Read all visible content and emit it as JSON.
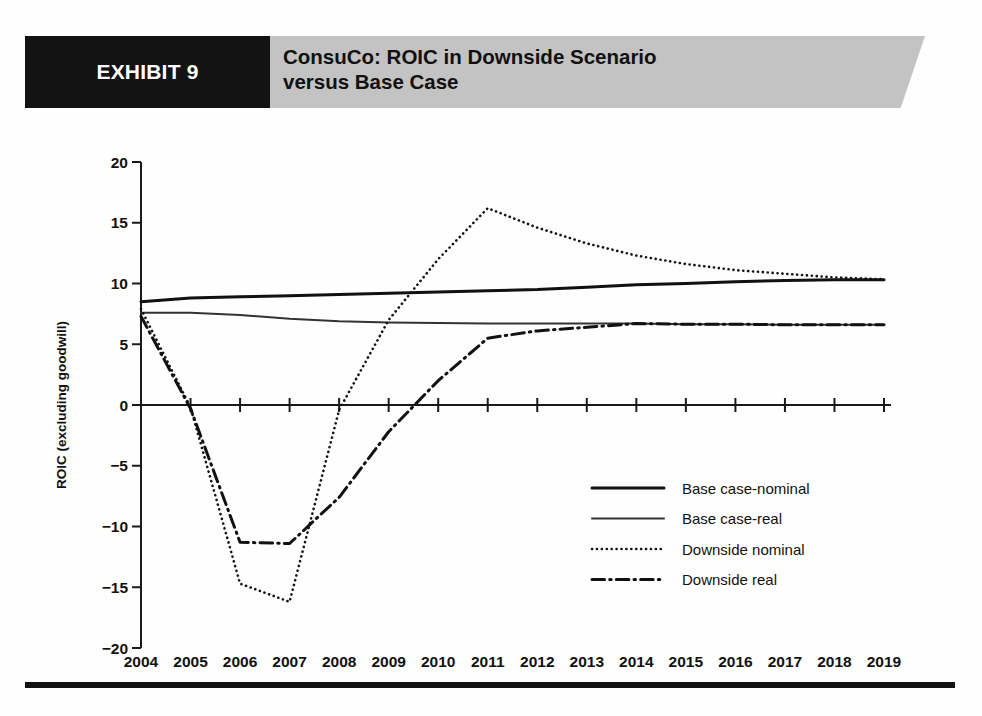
{
  "header": {
    "exhibit_label": "EXHIBIT 9",
    "title_line1": "ConsuCo: ROIC in Downside Scenario",
    "title_line2": "versus Base Case",
    "black_box_color": "#131313",
    "banner_color": "#c3c3c3"
  },
  "chart_data": {
    "type": "line",
    "title": "ConsuCo: ROIC in Downside Scenario versus Base Case",
    "xlabel": "",
    "ylabel": "ROIC (excluding goodwill)",
    "categories": [
      "2004",
      "2005",
      "2006",
      "2007",
      "2008",
      "2009",
      "2010",
      "2011",
      "2012",
      "2013",
      "2014",
      "2015",
      "2016",
      "2017",
      "2018",
      "2019"
    ],
    "x": [
      2004,
      2005,
      2006,
      2007,
      2008,
      2009,
      2010,
      2011,
      2012,
      2013,
      2014,
      2015,
      2016,
      2017,
      2018,
      2019
    ],
    "ylim": [
      -20,
      20
    ],
    "yticks": [
      20,
      15,
      10,
      5,
      0,
      -5,
      -10,
      -15,
      -20
    ],
    "ytick_labels": [
      "20",
      "15",
      "10",
      "5",
      "0",
      "−5",
      "−10",
      "−15",
      "−20"
    ],
    "grid": false,
    "legend_position": "center-right",
    "series": [
      {
        "name": "Base case-nominal",
        "style": "solid",
        "width": 3,
        "color": "#111111",
        "values": [
          8.5,
          8.8,
          8.9,
          9.0,
          9.1,
          9.2,
          9.3,
          9.4,
          9.5,
          9.7,
          9.9,
          10.0,
          10.15,
          10.25,
          10.3,
          10.3
        ]
      },
      {
        "name": "Base case-real",
        "style": "solid",
        "width": 2,
        "color": "#333333",
        "values": [
          7.6,
          7.6,
          7.4,
          7.1,
          6.9,
          6.8,
          6.75,
          6.7,
          6.7,
          6.7,
          6.7,
          6.65,
          6.65,
          6.6,
          6.6,
          6.6
        ]
      },
      {
        "name": "Downside nominal",
        "style": "dotted",
        "width": 2.6,
        "color": "#111111",
        "values": [
          7.9,
          -0.2,
          -14.7,
          -16.2,
          -0.4,
          7.0,
          12.0,
          16.2,
          14.6,
          13.3,
          12.3,
          11.6,
          11.1,
          10.8,
          10.5,
          10.35
        ]
      },
      {
        "name": "Downside real",
        "style": "dashdot",
        "width": 3,
        "color": "#111111",
        "values": [
          7.3,
          -0.3,
          -11.3,
          -11.4,
          -7.6,
          -2.2,
          2.0,
          5.5,
          6.1,
          6.4,
          6.7,
          6.65,
          6.65,
          6.6,
          6.6,
          6.6
        ]
      }
    ]
  },
  "legend": {
    "items": [
      {
        "label": "Base case-nominal",
        "style": "solid-thick"
      },
      {
        "label": "Base case-real",
        "style": "solid-thin"
      },
      {
        "label": "Downside nominal",
        "style": "dotted"
      },
      {
        "label": "Downside real",
        "style": "dashdot"
      }
    ]
  }
}
